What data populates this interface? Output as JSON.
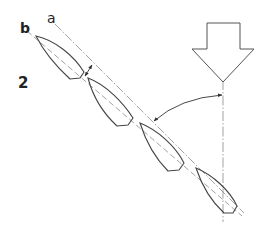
{
  "diagram": {
    "type": "sailing-course-diagram",
    "figure_number": "2",
    "line_labels": {
      "a": "a",
      "b": "b"
    },
    "wind_arrow": {
      "icon": "down-arrow-icon",
      "direction": "down"
    },
    "boats": [
      {
        "index": 1,
        "description": "boat hull outline, bow up-left"
      },
      {
        "index": 2,
        "description": "boat hull outline, bow up-left"
      },
      {
        "index": 3,
        "description": "boat hull outline, bow up-left"
      },
      {
        "index": 4,
        "description": "boat hull outline, bow up-left"
      }
    ],
    "annotations": [
      {
        "name": "offset-dimension-arrow",
        "description": "double-headed arrow between line a and line b"
      },
      {
        "name": "angle-arc-arrow",
        "description": "arc arrow between wind axis and course line"
      }
    ],
    "colors": {
      "stroke": "#3a3a3a",
      "dash": "#8a8a8a",
      "background": "#ffffff"
    }
  }
}
